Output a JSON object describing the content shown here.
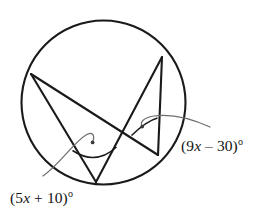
{
  "figure": {
    "kind": "circle-geometry-diagram",
    "stroke_color": "#1a1a1a",
    "leader_color": "#6e6e70",
    "background_color": "#ffffff",
    "circle": {
      "center_x": 103.5,
      "center_y": 102.5,
      "radius": 82
    },
    "points": [
      {
        "id": "A",
        "x": 31,
        "y": 74,
        "position": "upper-left"
      },
      {
        "id": "B",
        "x": 162,
        "y": 57,
        "position": "upper-right"
      },
      {
        "id": "C",
        "x": 158,
        "y": 155,
        "position": "lower-right"
      },
      {
        "id": "D",
        "x": 96,
        "y": 182,
        "position": "bottom"
      }
    ],
    "chords": [
      {
        "id": "A-D",
        "from": "A",
        "to": "D"
      },
      {
        "id": "A-C",
        "from": "A",
        "to": "C"
      },
      {
        "id": "B-D",
        "from": "B",
        "to": "D"
      },
      {
        "id": "B-C",
        "from": "B",
        "to": "C"
      }
    ],
    "angles": [
      {
        "id": "angle-at-D",
        "vertex": "D",
        "rays": [
          "A",
          "B"
        ],
        "label": "(5x + 10)",
        "label_prefix": "(5",
        "label_variable": "x",
        "label_suffix": " + 10)",
        "label_degree": "o",
        "label_x": 10,
        "label_y": 203
      },
      {
        "id": "angle-at-C",
        "vertex": "C",
        "rays": [
          "A",
          "B"
        ],
        "label": "(9x – 30)",
        "label_prefix": "(9",
        "label_variable": "x",
        "label_suffix": " – 30)",
        "label_degree": "o",
        "label_x": 181,
        "label_y": 151
      }
    ]
  }
}
